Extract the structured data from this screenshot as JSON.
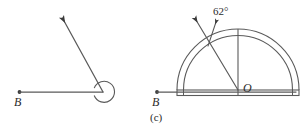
{
  "figure": {
    "caption": "(c)",
    "background_color": "#ffffff",
    "stroke_color": "#555555",
    "text_color": "#2b2b2b",
    "panels": [
      {
        "id": "left-panel",
        "name": "reflex-angle-diagram",
        "description": "An angle drawn at vertex with a horizontal ray to the left labelled B and a slanted ray pointing up-left, with a reflex-angle arc at the vertex",
        "labels": {
          "ray_endpoint": "B"
        },
        "elements": [
          "horizontal-ray",
          "slanted-ray-with-arrowhead",
          "reflex-angle-arc",
          "endpoint-dot"
        ]
      },
      {
        "id": "right-panel",
        "name": "protractor-diagram",
        "description": "A semicircular protractor resting on a base line with a ray from centre O drawn at 62 degrees, labelled with an arrow pointer",
        "labels": {
          "ray_endpoint": "B",
          "centre": "O",
          "angle_measure": "62°"
        },
        "elements": [
          "base-ray",
          "protractor-outer-semicircle",
          "protractor-inner-semicircle",
          "protractor-base-plate",
          "vertical-reference-line",
          "measured-ray-with-arrowhead",
          "angle-callout-arrow"
        ]
      }
    ]
  }
}
